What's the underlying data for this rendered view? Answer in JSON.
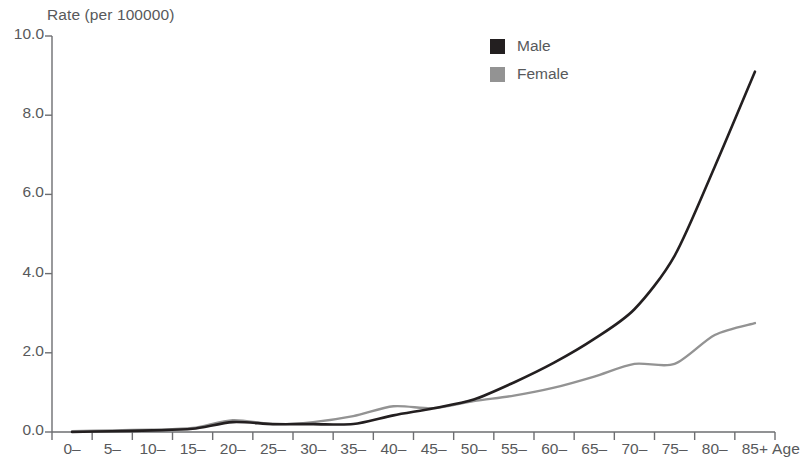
{
  "chart_data": {
    "type": "line",
    "title": "",
    "ylabel": "Rate (per 100000)",
    "xlabel": "Age",
    "ylim": [
      0,
      10
    ],
    "yticks": [
      "0.0",
      "2.0",
      "4.0",
      "6.0",
      "8.0",
      "10.0"
    ],
    "ytick_values": [
      0,
      2,
      4,
      6,
      8,
      10
    ],
    "grid": false,
    "legend_position": "top-center-right",
    "categories": [
      "0–",
      "5–",
      "10–",
      "15–",
      "20–",
      "25–",
      "30–",
      "35–",
      "40–",
      "45–",
      "50–",
      "55–",
      "60–",
      "65–",
      "70–",
      "75–",
      "80–",
      "85+"
    ],
    "series": [
      {
        "name": "Male",
        "color": "#231f20",
        "values": [
          0.0,
          0.02,
          0.04,
          0.08,
          0.25,
          0.2,
          0.2,
          0.2,
          0.42,
          0.6,
          0.82,
          1.25,
          1.75,
          2.35,
          3.1,
          4.45,
          6.7,
          9.1
        ]
      },
      {
        "name": "Female",
        "color": "#939393",
        "values": [
          0.02,
          0.04,
          0.06,
          0.1,
          0.3,
          0.2,
          0.25,
          0.4,
          0.65,
          0.6,
          0.78,
          0.92,
          1.12,
          1.4,
          1.72,
          1.72,
          2.45,
          2.75
        ]
      }
    ]
  },
  "legend": {
    "items": [
      {
        "label": "Male",
        "color": "#231f20"
      },
      {
        "label": "Female",
        "color": "#939393"
      }
    ]
  },
  "axes": {
    "y_title": "Rate (per 100000)",
    "x_title": "Age"
  }
}
